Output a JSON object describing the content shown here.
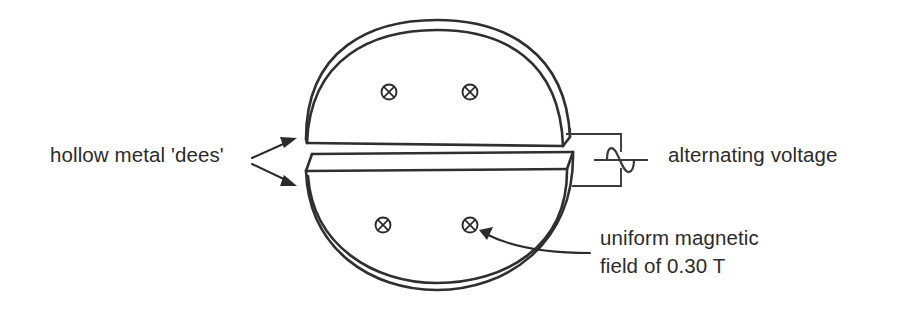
{
  "figure": {
    "type": "physics-schematic",
    "background_color": "#ffffff",
    "ink_color": "#2f2f2f",
    "text_color": "#2b2b2b"
  },
  "labels": {
    "dees": "hollow metal 'dees'",
    "alternating_voltage": "alternating voltage",
    "magnetic_field_line1": "uniform magnetic",
    "magnetic_field_line2": "field of 0.30 T"
  },
  "components": {
    "upper_dee": "upper hollow metal dee",
    "lower_dee": "lower hollow metal dee",
    "gap": "accelerating gap between dees",
    "ac_source": "alternating voltage source",
    "ac_symbol": "sine-wave-icon",
    "field_symbol": "field-into-page-icon"
  },
  "field_markers": {
    "symbol": "⊗",
    "meaning": "magnetic field directed into the page",
    "count": 4,
    "value": "0.30 T"
  },
  "pointers": {
    "dees_arrow_upper": "arrow to upper dee edge",
    "dees_arrow_lower": "arrow to lower dee edge",
    "field_arrow": "curved arrow to field marker"
  }
}
